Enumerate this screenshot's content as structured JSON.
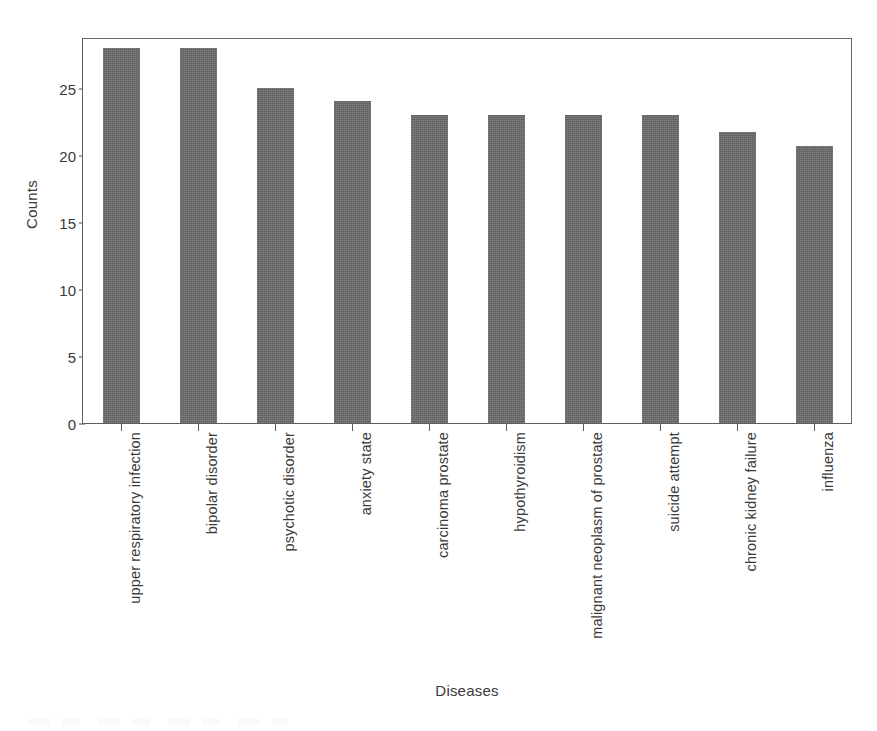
{
  "chart_data": {
    "type": "bar",
    "title": "",
    "xlabel": "Diseases",
    "ylabel": "Counts",
    "categories": [
      "upper respiratory infection",
      "bipolar disorder",
      "psychotic disorder",
      "anxiety state",
      "carcinoma prostate",
      "hypothyroidism",
      "malignant neoplasm of prostate",
      "suicide attempt",
      "chronic kidney failure",
      "influenza"
    ],
    "values": [
      28,
      28,
      25,
      24,
      23,
      23,
      23,
      23,
      21.7,
      20.7
    ],
    "ylim": [
      0,
      28.8
    ],
    "y_ticks": [
      0,
      5,
      10,
      15,
      20,
      25
    ],
    "y_tick_labels": [
      "0",
      "5",
      "10",
      "15",
      "20",
      "25"
    ],
    "grid": false,
    "legend": false,
    "bar_color": "#6b6b6b",
    "axis_color": "#5d5d5d",
    "text_color": "#3a3a3a"
  }
}
